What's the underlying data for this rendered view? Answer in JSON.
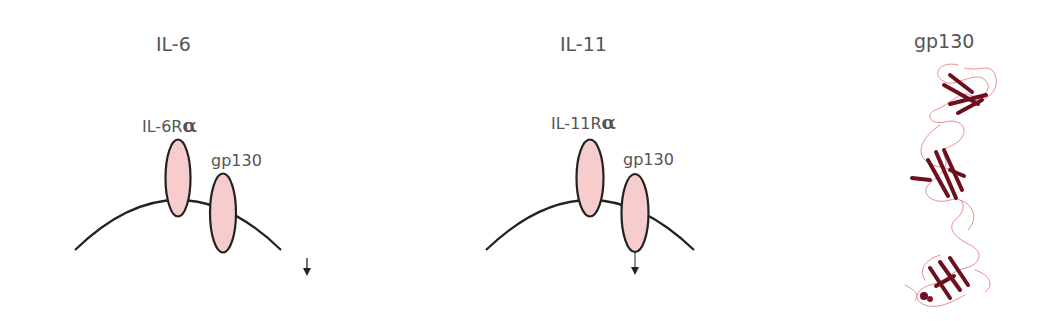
{
  "panels": [
    {
      "title": "IL-6",
      "receptor_alpha": {
        "prefix": "IL-6R",
        "greek": "α"
      },
      "gp130_label": "gp130",
      "signal_arrow": "down-arrow"
    },
    {
      "title": "IL-11",
      "receptor_alpha": {
        "prefix": "IL-11R",
        "greek": "α"
      },
      "gp130_label": "gp130",
      "signal_arrow": "down-arrow"
    },
    {
      "title": "gp130",
      "structure": "ribbon-protein-structure"
    }
  ],
  "colors": {
    "receptor_fill": "#f6cccc",
    "outline": "#222222",
    "ribbon_dark": "#6e0f1f",
    "ribbon_light": "#e88c8c",
    "text": "#555555"
  }
}
